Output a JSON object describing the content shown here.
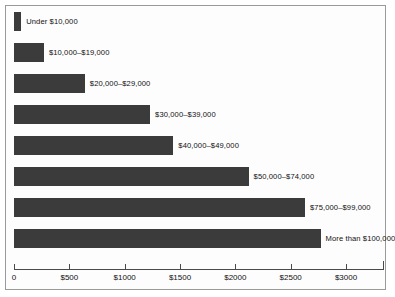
{
  "chart_data": {
    "type": "bar",
    "orientation": "horizontal",
    "title": "",
    "xlabel": "",
    "ylabel": "",
    "grid": false,
    "legend": null,
    "xlim": [
      0,
      3000
    ],
    "xticks": [
      0,
      500,
      1000,
      1500,
      2000,
      2500,
      3000
    ],
    "xtick_labels": [
      "0",
      "$500",
      "$1000",
      "$1500",
      "$2000",
      "$2500",
      "$3000"
    ],
    "categories": [
      "Under $10,000",
      "$10,000–$19,000",
      "$20,000–$29,000",
      "$30,000–$39,000",
      "$40,000–$49,000",
      "$50,000–$74,000",
      "$75,000–$99,000",
      "More than $100,000"
    ],
    "values": [
      65,
      270,
      640,
      1230,
      1440,
      2120,
      2630,
      2770
    ],
    "bar_color": "#3b3b3b",
    "background_color": "#fdfdfd",
    "border_color": "#9a9a9a"
  }
}
